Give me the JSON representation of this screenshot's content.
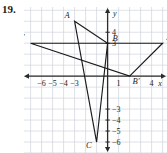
{
  "exercise": {
    "number": "19."
  },
  "graph": {
    "axis_labels": {
      "x": "x",
      "y": "y"
    },
    "x_ticks": [
      {
        "value": -6,
        "label": "−6"
      },
      {
        "value": -5,
        "label": "−5"
      },
      {
        "value": -4,
        "label": "−4"
      },
      {
        "value": -3,
        "label": "−3"
      },
      {
        "value": 1,
        "label": "1"
      },
      {
        "value": 4,
        "label": "4"
      }
    ],
    "y_ticks": [
      {
        "value": 4,
        "label": "4"
      },
      {
        "value": 3,
        "label": "3"
      },
      {
        "value": -3,
        "label": "−3"
      },
      {
        "value": -4,
        "label": "−4"
      },
      {
        "value": -5,
        "label": "−5"
      },
      {
        "value": -6,
        "label": "−6"
      }
    ],
    "points": [
      {
        "name": "A",
        "label": "A",
        "x": -3,
        "y": 5
      },
      {
        "name": "B",
        "label": "B",
        "x": 0,
        "y": 3
      },
      {
        "name": "C",
        "label": "C",
        "x": -1,
        "y": -6
      },
      {
        "name": "A'",
        "label": "A′",
        "x": 5,
        "y": 3
      },
      {
        "name": "B'",
        "label": "B′",
        "x": 2,
        "y": 0
      },
      {
        "name": "C'",
        "label": "C′",
        "x": -7,
        "y": 3
      }
    ],
    "triangles": [
      {
        "name": "ABC",
        "vertices": [
          "A",
          "B",
          "C"
        ]
      },
      {
        "name": "A'B'C'",
        "vertices": [
          "A'",
          "B'",
          "C'"
        ]
      }
    ],
    "colors": {
      "grid": "#cfd4de",
      "axis": "#2b2b2b",
      "figure": "#1a1a1a",
      "label": "#1a1a1a"
    },
    "view": {
      "xmin": -7.6,
      "xmax": 5.4,
      "ymin": -7.0,
      "ymax": 6.3
    },
    "grid": true
  },
  "chart_data": {
    "type": "scatter",
    "title": "",
    "xlabel": "x",
    "ylabel": "y",
    "xlim": [
      -7.6,
      5.4
    ],
    "ylim": [
      -7.0,
      6.3
    ],
    "grid": true,
    "xticks": [
      -6,
      -5,
      -4,
      -3,
      1,
      4
    ],
    "yticks": [
      4,
      3,
      -3,
      -4,
      -5,
      -6
    ],
    "series": [
      {
        "name": "Triangle ABC",
        "points": [
          {
            "label": "A",
            "x": -3,
            "y": 5
          },
          {
            "label": "B",
            "x": 0,
            "y": 3
          },
          {
            "label": "C",
            "x": -1,
            "y": -6
          }
        ],
        "closed": true
      },
      {
        "name": "Triangle A'B'C'",
        "points": [
          {
            "label": "A′",
            "x": 5,
            "y": 3
          },
          {
            "label": "B′",
            "x": 2,
            "y": 0
          },
          {
            "label": "C′",
            "x": -7,
            "y": 3
          }
        ],
        "closed": true
      }
    ]
  }
}
